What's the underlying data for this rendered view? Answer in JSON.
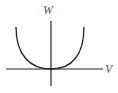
{
  "diagram": {
    "type": "function-curve",
    "y_axis_label": "W",
    "x_axis_label": "V",
    "line_color": "#222222",
    "background": "#ffffff"
  }
}
